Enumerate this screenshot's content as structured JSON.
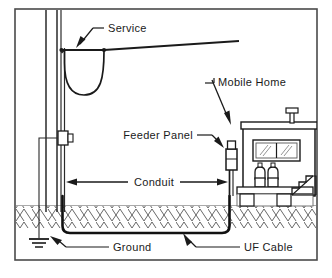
{
  "figure": {
    "kind": "electrical-service-diagram",
    "border_color": "#4a4a4a",
    "line_color": "#1a1a1a",
    "fill_color": "#ffffff",
    "background": "#ffffff"
  },
  "labels": {
    "service": "Service",
    "mobile_home": "Mobile Home",
    "feeder_panel": "Feeder Panel",
    "conduit": "Conduit",
    "ground": "Ground",
    "uf_cable": "UF Cable"
  },
  "components": {
    "utility_pole": "utility-pole",
    "service_drop": "service-drop-wire",
    "drip_loop": "drip-loop",
    "riser_conduit": "riser-conduit",
    "weatherhead_box": "pole-connector-box",
    "ground_rod": "ground-rod",
    "ground_electrode_symbol": "earth-ground-symbol",
    "underground_conduit": "underground-conduit-run",
    "feeder_panel_box": "feeder-panel-enclosure",
    "mobile_home_body": "mobile-home-structure",
    "roof_vent": "roof-vent-pipe",
    "window": "mobile-home-window",
    "propane_tanks": "propane-tank-pair",
    "skirting": "skirting-and-piers",
    "entry_steps": "entry-steps",
    "grade_line": "grade-line",
    "earth_hatch": "earth-hatching"
  }
}
